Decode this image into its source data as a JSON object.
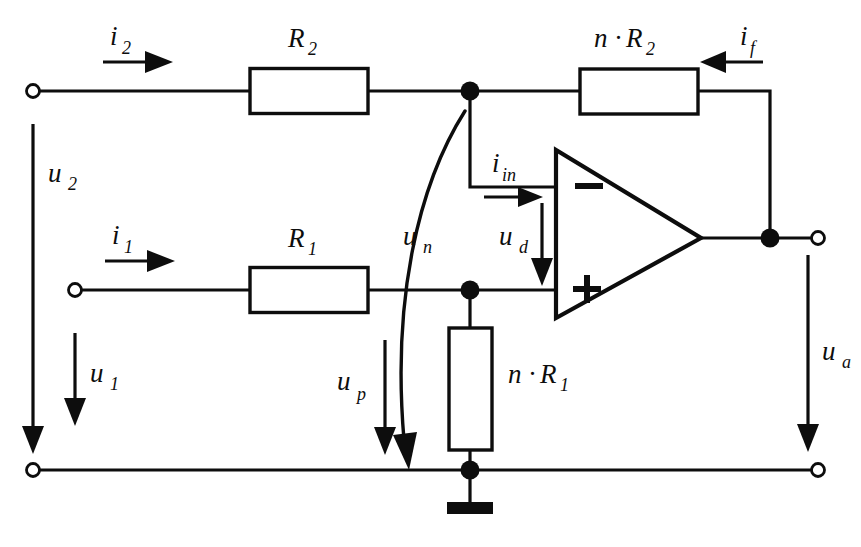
{
  "diagram": {
    "type": "electrical-schematic",
    "background_color": "#ffffff",
    "line_color": "#0d0d0d"
  },
  "components": {
    "resistor_r2": {
      "label_base": "R",
      "label_sub": "2",
      "full_label": "R2"
    },
    "resistor_r1": {
      "label_base": "R",
      "label_sub": "1",
      "full_label": "R1"
    },
    "resistor_nr2": {
      "coef": "n",
      "dot": "·",
      "label_base": "R",
      "label_sub": "2",
      "full_label": "n·R2"
    },
    "resistor_nr1": {
      "coef": "n",
      "dot": "·",
      "label_base": "R",
      "label_sub": "1",
      "full_label": "n·R1"
    },
    "opamp": {
      "minus_sign": "−",
      "plus_sign": "+",
      "name": "operational-amplifier"
    },
    "ground": {
      "name": "ground-symbol"
    }
  },
  "currents": {
    "i2": {
      "base": "i",
      "sub": "2",
      "full": "i2",
      "direction": "right"
    },
    "i1": {
      "base": "i",
      "sub": "1",
      "full": "i1",
      "direction": "right"
    },
    "if": {
      "base": "i",
      "sub": "f",
      "full": "if",
      "direction": "left"
    },
    "iin": {
      "base": "i",
      "sub": "in",
      "full": "iin",
      "direction": "right"
    }
  },
  "voltages": {
    "u2": {
      "base": "u",
      "sub": "2",
      "full": "u2",
      "direction": "down"
    },
    "u1": {
      "base": "u",
      "sub": "1",
      "full": "u1",
      "direction": "down"
    },
    "un": {
      "base": "u",
      "sub": "n",
      "full": "un",
      "direction": "down-curved"
    },
    "up": {
      "base": "u",
      "sub": "p",
      "full": "up",
      "direction": "down"
    },
    "ud": {
      "base": "u",
      "sub": "d",
      "full": "ud",
      "direction": "down"
    },
    "ua": {
      "base": "u",
      "sub": "a",
      "full": "ua",
      "direction": "down"
    }
  },
  "terminals": [
    {
      "name": "input-terminal-top-left",
      "x": 33,
      "y": 91
    },
    {
      "name": "input-terminal-middle-left",
      "x": 75,
      "y": 290
    },
    {
      "name": "reference-terminal-bottom-left",
      "x": 33,
      "y": 470
    },
    {
      "name": "output-terminal-right",
      "x": 818,
      "y": 238
    },
    {
      "name": "reference-terminal-bottom-right",
      "x": 818,
      "y": 470
    }
  ],
  "nodes": [
    {
      "name": "node-inverting-top",
      "x": 470,
      "y": 91
    },
    {
      "name": "node-noninverting",
      "x": 470,
      "y": 290
    },
    {
      "name": "node-ground",
      "x": 470,
      "y": 470
    },
    {
      "name": "node-output",
      "x": 770,
      "y": 238
    }
  ]
}
